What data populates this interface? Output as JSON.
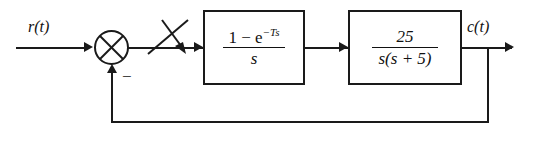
{
  "diagram": {
    "input_label": "r(t)",
    "output_label": "c(t)",
    "sum_sign_negative": "−",
    "sum_junction_name": "summing-junction",
    "sampler_name": "sampler-switch",
    "blocks": [
      {
        "id": "zero-order-hold",
        "numerator": "1 − e",
        "numerator_exponent": "−Ts",
        "denominator": "s",
        "transfer_function": "(1 − e^(−Ts))/s"
      },
      {
        "id": "plant",
        "numerator": "25",
        "denominator": "s(s + 5)",
        "transfer_function": "25/(s(s+5))"
      }
    ],
    "feedback": {
      "type": "unity",
      "gain": "1"
    },
    "caption": "",
    "colors": {
      "line": "#1a1a1a",
      "background": "#ffffff",
      "text": "#111111"
    }
  }
}
